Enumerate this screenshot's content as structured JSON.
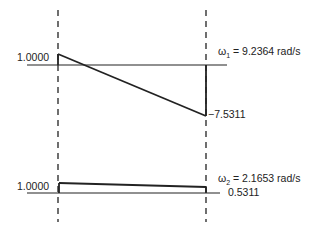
{
  "diagram": {
    "type": "mode-shape",
    "modes": [
      {
        "name": "mode-1",
        "frequency_label": "ω",
        "frequency_sub": "1",
        "frequency_text": "= 9.2364 rad/s",
        "left_value": "1.0000",
        "right_value": "−7.5311"
      },
      {
        "name": "mode-2",
        "frequency_label": "ω",
        "frequency_sub": "2",
        "frequency_text": "= 2.1653 rad/s",
        "left_value": "1.0000",
        "right_value": "0.5311"
      }
    ]
  }
}
